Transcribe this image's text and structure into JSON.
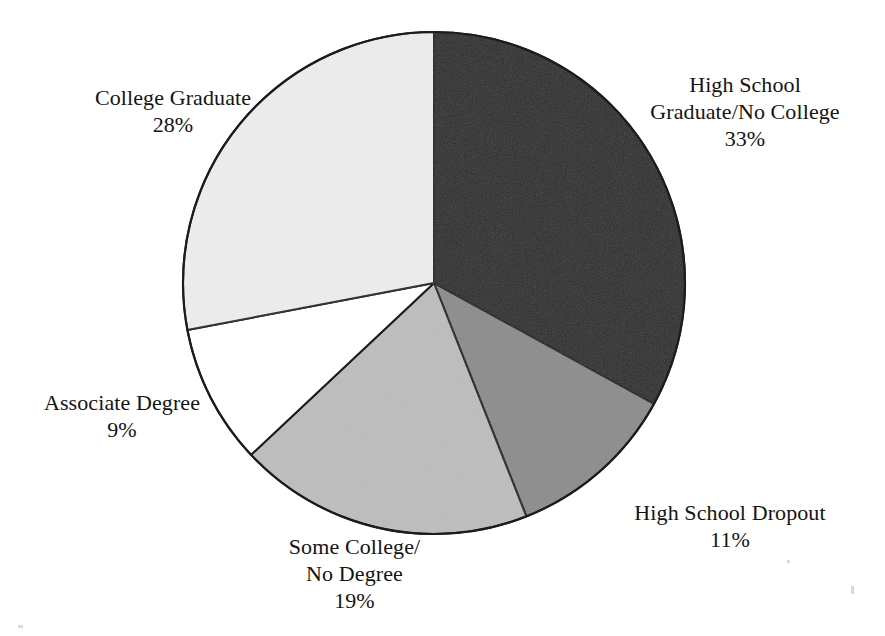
{
  "figure": {
    "background_color": "#ffffff",
    "text_color": "#141414",
    "outline_color": "#1c1c1c"
  },
  "chart_data": {
    "type": "pie",
    "title": "",
    "subtitle": "",
    "xlabel": "",
    "ylabel": "",
    "legend_position": "none",
    "grid": false,
    "start_angle_deg": 0,
    "direction": "clockwise",
    "center": {
      "x": 434,
      "y": 283
    },
    "radius": 251,
    "units": "percent",
    "total": 100,
    "categories": [
      "High School Graduate/No College",
      "High School Dropout",
      "Some College/No Degree",
      "Associate Degree",
      "College Graduate"
    ],
    "values": [
      33,
      11,
      19,
      9,
      28
    ],
    "slices": [
      {
        "id": "hs-grad",
        "label": "High School Graduate/No College",
        "label_lines": [
          "High School",
          "Graduate/No College"
        ],
        "value": 33,
        "value_text": "33%",
        "color": "#2b2b2b",
        "start_deg": 0,
        "end_deg": 118.8
      },
      {
        "id": "hs-dropout",
        "label": "High School Dropout",
        "label_lines": [
          "High School Dropout"
        ],
        "value": 11,
        "value_text": "11%",
        "color": "#8c8c8c",
        "start_deg": 118.8,
        "end_deg": 158.4
      },
      {
        "id": "some-college",
        "label": "Some College/No Degree",
        "label_lines": [
          "Some College/",
          "No Degree"
        ],
        "value": 19,
        "value_text": "19%",
        "color": "#bdbdbd",
        "start_deg": 158.4,
        "end_deg": 226.8
      },
      {
        "id": "associate",
        "label": "Associate Degree",
        "label_lines": [
          "Associate Degree"
        ],
        "value": 9,
        "value_text": "9%",
        "color": "#ffffff",
        "start_deg": 226.8,
        "end_deg": 259.2
      },
      {
        "id": "college-grad",
        "label": "College Graduate",
        "label_lines": [
          "College Graduate"
        ],
        "value": 28,
        "value_text": "28%",
        "color": "#ededed",
        "start_deg": 259.2,
        "end_deg": 360
      }
    ]
  },
  "labels": {
    "hs_grad": {
      "line1": "High School",
      "line2": "Graduate/No College",
      "value": "33%"
    },
    "hs_dropout": {
      "line1": "High School Dropout",
      "value": "11%"
    },
    "some_college": {
      "line1": "Some College/",
      "line2": "No Degree",
      "value": "19%"
    },
    "associate": {
      "line1": "Associate Degree",
      "value": "9%"
    },
    "college_grad": {
      "line1": "College Graduate",
      "value": "28%"
    }
  }
}
